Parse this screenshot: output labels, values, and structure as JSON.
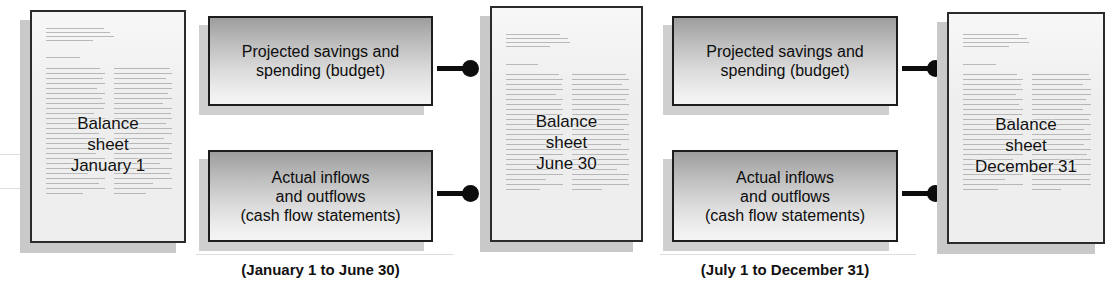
{
  "diagram": {
    "documents": [
      {
        "id": "balance-sheet-january-1",
        "label": "Balance\nsheet\nJanuary 1"
      },
      {
        "id": "balance-sheet-june-30",
        "label": "Balance\nsheet\nJune 30"
      },
      {
        "id": "balance-sheet-december-31",
        "label": "Balance\nsheet\nDecember 31"
      }
    ],
    "boxes": [
      {
        "id": "projected-h1",
        "label": "Projected savings and\nspending (budget)"
      },
      {
        "id": "actual-h1",
        "label": "Actual inflows\nand outflows\n(cash flow statements)"
      },
      {
        "id": "projected-h2",
        "label": "Projected savings and\nspending (budget)"
      },
      {
        "id": "actual-h2",
        "label": "Actual inflows\nand outflows\n(cash flow statements)"
      }
    ],
    "captions": [
      {
        "id": "period-first-half",
        "text": "(January 1 to June 30)"
      },
      {
        "id": "period-second-half",
        "text": "(July 1 to December 31)"
      }
    ],
    "colors": {
      "page_fill": "#eeeeee",
      "page_border": "#2b2b2b",
      "page_shadow": "#c9c9c9",
      "box_gradient_top": "#9d9d9d",
      "box_gradient_bottom": "#f4f4f4",
      "box_border": "#1d1d1d",
      "connector": "#0d0d0d",
      "background": "#ffffff"
    }
  }
}
